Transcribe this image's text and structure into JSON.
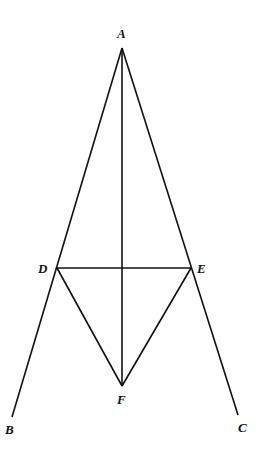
{
  "diagram": {
    "points": {
      "A": {
        "label": "A",
        "x": 122,
        "y": 48
      },
      "B": {
        "label": "B",
        "x": 12,
        "y": 417
      },
      "C": {
        "label": "C",
        "x": 238,
        "y": 415
      },
      "D": {
        "label": "D",
        "x": 57,
        "y": 268
      },
      "E": {
        "label": "E",
        "x": 191,
        "y": 268
      },
      "F": {
        "label": "F",
        "x": 122,
        "y": 386
      }
    },
    "segments": [
      [
        "A",
        "B"
      ],
      [
        "A",
        "C"
      ],
      [
        "A",
        "F"
      ],
      [
        "D",
        "E"
      ],
      [
        "D",
        "F"
      ],
      [
        "E",
        "F"
      ]
    ]
  }
}
